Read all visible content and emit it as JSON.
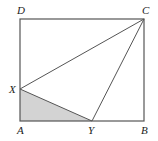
{
  "diagram": {
    "type": "geometry",
    "colors": {
      "stroke": "#555555",
      "shade": "#d3d3d3",
      "label": "#222222",
      "background": "#ffffff"
    },
    "points": {
      "A": {
        "label": "A",
        "x": 20,
        "y": 121
      },
      "B": {
        "label": "B",
        "x": 144,
        "y": 121
      },
      "C": {
        "label": "C",
        "x": 144,
        "y": 19
      },
      "D": {
        "label": "D",
        "x": 20,
        "y": 19
      },
      "X": {
        "label": "X",
        "x": 20,
        "y": 89
      },
      "Y": {
        "label": "Y",
        "x": 92,
        "y": 121
      }
    },
    "segments": [
      "AB",
      "BC",
      "CD",
      "DA",
      "XC",
      "YC",
      "XY"
    ],
    "shaded_region": "triangle AXY"
  }
}
